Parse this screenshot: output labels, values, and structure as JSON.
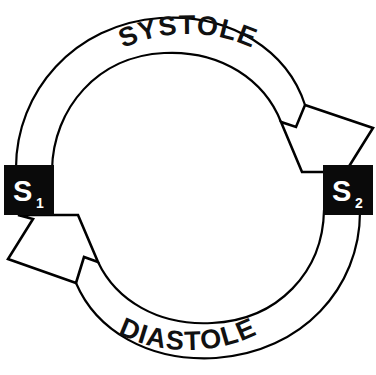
{
  "diagram": {
    "background_color": "#ffffff",
    "stroke_color": "#000000",
    "node_fill_color": "#0a0a0a",
    "node_text_color": "#ffffff",
    "nodes": [
      {
        "id": "s1",
        "label": "S",
        "subscript": "1",
        "position": "left",
        "x": 4,
        "y": 165,
        "width": 50,
        "height": 50
      },
      {
        "id": "s2",
        "label": "S",
        "subscript": "2",
        "position": "right",
        "x": 323,
        "y": 165,
        "width": 50,
        "height": 50
      }
    ],
    "arcs": [
      {
        "id": "systole",
        "label": "SYSTOLE",
        "from": "s1",
        "to": "s2",
        "direction": "clockwise",
        "side": "top"
      },
      {
        "id": "diastole",
        "label": "DIASTOLE",
        "from": "s2",
        "to": "s1",
        "direction": "counterclockwise",
        "side": "bottom"
      }
    ]
  }
}
